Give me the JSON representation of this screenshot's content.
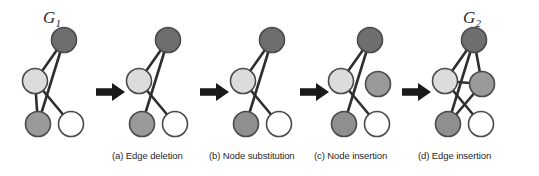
{
  "figure": {
    "title_left": "G",
    "title_left_sub": "1",
    "title_right": "G",
    "title_right_sub": "2",
    "width": 539,
    "height": 176,
    "background": "#ffffff"
  },
  "palette": {
    "node_dark": "#6e6e6e",
    "node_medium": "#9a9a9a",
    "node_light": "#dcdcdc",
    "node_white": "#ffffff",
    "node_stroke": "#4a4a4a",
    "edge": "#2e2e2e",
    "arrow": "#1a1a1a",
    "text": "#1f1f1f"
  },
  "captions": [
    {
      "id": "a",
      "label": "(a) Edge deletion"
    },
    {
      "id": "b",
      "label": "(b) Node substitution"
    },
    {
      "id": "c",
      "label": "(c) Node insertion"
    },
    {
      "id": "d",
      "label": "(d) Edge insertion"
    }
  ],
  "arrows": [
    {
      "name": "arrow-1",
      "glyph": "right-arrow"
    },
    {
      "name": "arrow-2",
      "glyph": "right-arrow"
    },
    {
      "name": "arrow-3",
      "glyph": "right-arrow"
    },
    {
      "name": "arrow-4",
      "glyph": "right-arrow"
    }
  ],
  "graphs": [
    {
      "id": "g1",
      "name": "graph-g1",
      "label": "G1",
      "nodes": [
        {
          "id": "n-dark",
          "x": 50,
          "y": 22,
          "r": 12.5,
          "fill": "#6e6e6e"
        },
        {
          "id": "n-light",
          "x": 21,
          "y": 63,
          "r": 12.5,
          "fill": "#dcdcdc"
        },
        {
          "id": "n-gray",
          "x": 24,
          "y": 106,
          "r": 12.5,
          "fill": "#9a9a9a"
        },
        {
          "id": "n-white",
          "x": 57,
          "y": 106,
          "r": 12.5,
          "fill": "#ffffff"
        }
      ],
      "edges": [
        {
          "from": "n-dark",
          "to": "n-light"
        },
        {
          "from": "n-dark",
          "to": "n-gray"
        },
        {
          "from": "n-light",
          "to": "n-gray"
        },
        {
          "from": "n-light",
          "to": "n-white"
        }
      ]
    },
    {
      "id": "g2",
      "name": "graph-after-edge-deletion",
      "label": "",
      "nodes": [
        {
          "id": "n-dark",
          "x": 50,
          "y": 22,
          "r": 12.5,
          "fill": "#6e6e6e"
        },
        {
          "id": "n-light",
          "x": 21,
          "y": 63,
          "r": 12.5,
          "fill": "#dcdcdc"
        },
        {
          "id": "n-gray",
          "x": 24,
          "y": 106,
          "r": 12.5,
          "fill": "#9a9a9a"
        },
        {
          "id": "n-white",
          "x": 57,
          "y": 106,
          "r": 12.5,
          "fill": "#ffffff"
        }
      ],
      "edges": [
        {
          "from": "n-dark",
          "to": "n-light"
        },
        {
          "from": "n-dark",
          "to": "n-gray"
        },
        {
          "from": "n-light",
          "to": "n-white"
        }
      ]
    },
    {
      "id": "g3",
      "name": "graph-after-node-substitution",
      "label": "",
      "nodes": [
        {
          "id": "n-dark",
          "x": 50,
          "y": 22,
          "r": 12.5,
          "fill": "#6e6e6e"
        },
        {
          "id": "n-light",
          "x": 21,
          "y": 63,
          "r": 12.5,
          "fill": "#dcdcdc"
        },
        {
          "id": "n-gray",
          "x": 24,
          "y": 106,
          "r": 12.5,
          "fill": "#8f8f8f"
        },
        {
          "id": "n-white",
          "x": 57,
          "y": 106,
          "r": 12.5,
          "fill": "#ffffff"
        }
      ],
      "edges": [
        {
          "from": "n-dark",
          "to": "n-light"
        },
        {
          "from": "n-dark",
          "to": "n-gray"
        },
        {
          "from": "n-light",
          "to": "n-white"
        }
      ]
    },
    {
      "id": "g4",
      "name": "graph-after-node-insertion",
      "label": "",
      "nodes": [
        {
          "id": "n-dark",
          "x": 50,
          "y": 22,
          "r": 12.5,
          "fill": "#6e6e6e"
        },
        {
          "id": "n-light",
          "x": 21,
          "y": 63,
          "r": 12.5,
          "fill": "#dcdcdc"
        },
        {
          "id": "n-new",
          "x": 58,
          "y": 66,
          "r": 12.5,
          "fill": "#9a9a9a"
        },
        {
          "id": "n-gray",
          "x": 24,
          "y": 106,
          "r": 12.5,
          "fill": "#8f8f8f"
        },
        {
          "id": "n-white",
          "x": 57,
          "y": 106,
          "r": 12.5,
          "fill": "#ffffff"
        }
      ],
      "edges": [
        {
          "from": "n-dark",
          "to": "n-light"
        },
        {
          "from": "n-dark",
          "to": "n-gray"
        },
        {
          "from": "n-light",
          "to": "n-white"
        }
      ]
    },
    {
      "id": "g5",
      "name": "graph-g2",
      "label": "G2",
      "nodes": [
        {
          "id": "n-dark",
          "x": 50,
          "y": 22,
          "r": 12.5,
          "fill": "#6e6e6e"
        },
        {
          "id": "n-light",
          "x": 21,
          "y": 63,
          "r": 12.5,
          "fill": "#dcdcdc"
        },
        {
          "id": "n-new",
          "x": 58,
          "y": 66,
          "r": 12.5,
          "fill": "#9a9a9a"
        },
        {
          "id": "n-gray",
          "x": 24,
          "y": 106,
          "r": 12.5,
          "fill": "#8f8f8f"
        },
        {
          "id": "n-white",
          "x": 57,
          "y": 106,
          "r": 12.5,
          "fill": "#ffffff"
        }
      ],
      "edges": [
        {
          "from": "n-dark",
          "to": "n-light"
        },
        {
          "from": "n-dark",
          "to": "n-gray"
        },
        {
          "from": "n-dark",
          "to": "n-new"
        },
        {
          "from": "n-light",
          "to": "n-white"
        },
        {
          "from": "n-light",
          "to": "n-new"
        },
        {
          "from": "n-new",
          "to": "n-gray"
        }
      ]
    }
  ],
  "layout": {
    "panels": [
      {
        "id": "g1",
        "left": 14,
        "top": 0,
        "width": 90
      },
      {
        "id": "g2",
        "left": 118,
        "top": 0,
        "width": 90
      },
      {
        "id": "g3",
        "left": 222,
        "top": 0,
        "width": 90
      },
      {
        "id": "g4",
        "left": 320,
        "top": 0,
        "width": 90
      },
      {
        "id": "g5",
        "left": 424,
        "top": 0,
        "width": 90
      }
    ],
    "arrows": [
      {
        "left": 96
      },
      {
        "left": 200
      },
      {
        "left": 300
      },
      {
        "left": 402
      }
    ],
    "labels": [
      {
        "id": "g1",
        "left": 43,
        "top": 8
      },
      {
        "id": "g5",
        "left": 463,
        "top": 8
      }
    ],
    "captions": [
      {
        "id": "a",
        "left": 112
      },
      {
        "id": "b",
        "left": 209
      },
      {
        "id": "c",
        "left": 314
      },
      {
        "id": "d",
        "left": 418
      }
    ]
  }
}
